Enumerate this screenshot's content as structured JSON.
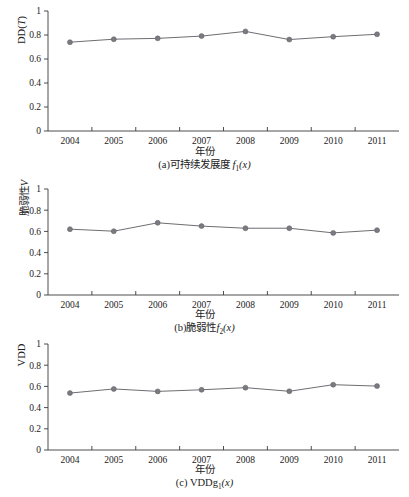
{
  "figure": {
    "x_axis_title": "年份",
    "y_ticks": [
      "0",
      "0.2",
      "0.4",
      "0.6",
      "0.8",
      "1"
    ],
    "y_tick_values": [
      0,
      0.2,
      0.4,
      0.6,
      0.8,
      1
    ],
    "x_tick_labels": [
      "2004",
      "2005",
      "2006",
      "2007",
      "2008",
      "2009",
      "2010",
      "2011"
    ]
  },
  "panels": {
    "a": {
      "ylabel_main": "DD(",
      "ylabel_italic": "T",
      "ylabel_tail": ")",
      "caption_prefix": "(a)可持续发展度 ",
      "caption_italic": "f",
      "caption_sub": "1",
      "caption_tail": "(x)"
    },
    "b": {
      "ylabel_main": "脆弱性",
      "ylabel_italic": "V",
      "ylabel_tail": "",
      "caption_prefix": "(b)脆弱性",
      "caption_italic": "f",
      "caption_sub": "2",
      "caption_tail": "(x)"
    },
    "c": {
      "ylabel_main": "VDD",
      "ylabel_italic": "",
      "ylabel_tail": "",
      "caption_prefix": "(c) VDDg",
      "caption_italic": "",
      "caption_sub": "1",
      "caption_tail": "(x)"
    }
  },
  "chart_data": [
    {
      "type": "line",
      "panel": "a",
      "title": "(a)可持续发展度 f1(x)",
      "xlabel": "年份",
      "ylabel": "DD(T)",
      "categories": [
        "2004",
        "2005",
        "2006",
        "2007",
        "2008",
        "2009",
        "2010",
        "2011"
      ],
      "x": [
        2004,
        2005,
        2006,
        2007,
        2008,
        2009,
        2010,
        2011
      ],
      "values": [
        0.74,
        0.765,
        0.772,
        0.791,
        0.83,
        0.762,
        0.786,
        0.806
      ],
      "ylim": [
        0,
        1
      ],
      "yticks": [
        0,
        0.2,
        0.4,
        0.6,
        0.8,
        1
      ],
      "grid": false,
      "legend": "none",
      "marker": "circle",
      "line_color": "#6e6e72",
      "marker_color": "#7a7a80"
    },
    {
      "type": "line",
      "panel": "b",
      "title": "(b)脆弱性 f2(x)",
      "xlabel": "年份",
      "ylabel": "脆弱性V",
      "categories": [
        "2004",
        "2005",
        "2006",
        "2007",
        "2008",
        "2009",
        "2010",
        "2011"
      ],
      "x": [
        2004,
        2005,
        2006,
        2007,
        2008,
        2009,
        2010,
        2011
      ],
      "values": [
        0.621,
        0.602,
        0.681,
        0.65,
        0.63,
        0.63,
        0.586,
        0.612
      ],
      "ylim": [
        0,
        1
      ],
      "yticks": [
        0,
        0.2,
        0.4,
        0.6,
        0.8,
        1
      ],
      "grid": false,
      "legend": "none",
      "marker": "circle",
      "line_color": "#6e6e72",
      "marker_color": "#7a7a80"
    },
    {
      "type": "line",
      "panel": "c",
      "title": "(c) VDDg1(x)",
      "xlabel": "年份",
      "ylabel": "VDD",
      "categories": [
        "2004",
        "2005",
        "2006",
        "2007",
        "2008",
        "2009",
        "2010",
        "2011"
      ],
      "x": [
        2004,
        2005,
        2006,
        2007,
        2008,
        2009,
        2010,
        2011
      ],
      "values": [
        0.537,
        0.576,
        0.553,
        0.568,
        0.588,
        0.554,
        0.616,
        0.603
      ],
      "ylim": [
        0,
        1
      ],
      "yticks": [
        0,
        0.2,
        0.4,
        0.6,
        0.8,
        1
      ],
      "grid": false,
      "legend": "none",
      "marker": "circle",
      "line_color": "#6e6e72",
      "marker_color": "#7a7a80"
    }
  ]
}
